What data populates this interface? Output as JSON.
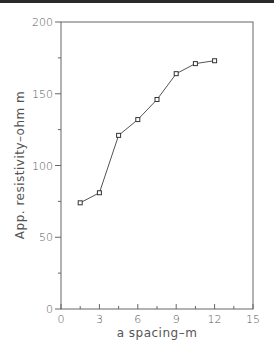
{
  "chart_data": {
    "type": "line",
    "title": "",
    "xlabel": "a spacing–m",
    "ylabel": "App. resistivity–ohm m",
    "xlim": [
      0,
      15
    ],
    "ylim": [
      0,
      200
    ],
    "x_ticks": [
      0,
      3,
      6,
      9,
      12,
      15
    ],
    "x_minor_step": 1.5,
    "y_ticks": [
      0,
      50,
      100,
      150,
      200
    ],
    "y_minor_step": 25,
    "grid": false,
    "legend": null,
    "marker": "square",
    "series": [
      {
        "name": "apparent resistivity",
        "x": [
          1.5,
          3,
          4.5,
          6,
          7.5,
          9,
          10.5,
          12
        ],
        "y": [
          74,
          81,
          121,
          132,
          146,
          164,
          171,
          173
        ]
      }
    ],
    "colors": {
      "line": "#555555",
      "axis": "#666666",
      "text": "#555555"
    }
  }
}
